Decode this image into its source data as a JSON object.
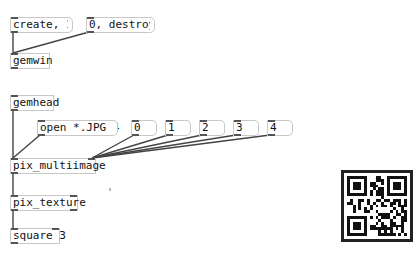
{
  "canvas": {
    "background": "#ffffff",
    "objects": {
      "create_msg": {
        "text": "create, 1",
        "type": "message"
      },
      "destroy_msg": {
        "text": "0, destroy",
        "type": "message"
      },
      "gemwin": {
        "text": "gemwin",
        "type": "object"
      },
      "gemhead": {
        "text": "gemhead",
        "type": "object"
      },
      "open_msg": {
        "text": "open *.JPG 4",
        "type": "message"
      },
      "index_msgs": [
        "0",
        "1",
        "2",
        "3",
        "4"
      ],
      "pix_multiimage": {
        "text": "pix_multiimage",
        "type": "object"
      },
      "pix_texture": {
        "text": "pix_texture",
        "type": "object"
      },
      "square": {
        "text": "square 3",
        "type": "object"
      }
    },
    "qr_code": {
      "label": "qr-code"
    }
  }
}
